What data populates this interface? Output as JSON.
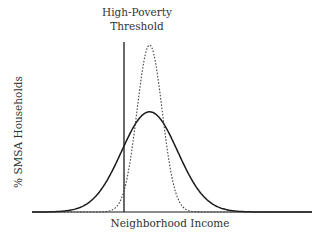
{
  "chart_data": {
    "type": "line",
    "title": "",
    "xlabel": "Neighborhood Income",
    "ylabel": "% SMSA Households",
    "annotations": [
      {
        "text": "High-Poverty Threshold",
        "type": "vertical-line",
        "x_relative": 0.33
      }
    ],
    "series": [
      {
        "name": "Broad distribution (solid)",
        "style": "solid",
        "shape": "normal",
        "peak_x_relative": 0.42,
        "peak_height_relative": 0.6,
        "width_sd_relative": 0.1
      },
      {
        "name": "Narrow distribution (dotted)",
        "style": "dotted",
        "shape": "normal",
        "peak_x_relative": 0.42,
        "peak_height_relative": 1.0,
        "width_sd_relative": 0.045
      }
    ],
    "grid": false,
    "legend": "none",
    "axis_ticks": "none"
  },
  "labels": {
    "threshold_line1": "High-Poverty",
    "threshold_line2": "Threshold",
    "xlabel": "Neighborhood Income",
    "ylabel": "% SMSA Households"
  },
  "colors": {
    "line": "#1a1a1a",
    "dotted": "#444444"
  }
}
